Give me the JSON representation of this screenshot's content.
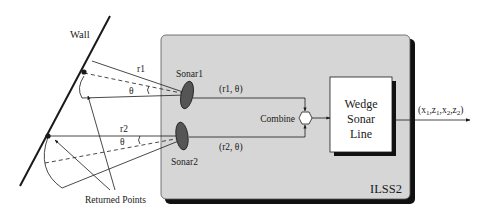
{
  "diagram": {
    "wall": {
      "label": "Wall"
    },
    "beams": [
      {
        "range_label": "r1",
        "angle_label": "θ"
      },
      {
        "range_label": "r2",
        "angle_label": "θ"
      }
    ],
    "returned_points": {
      "label": "Returned Points"
    },
    "system_box": {
      "label": "ILSS2",
      "fill": "#d6d6d6",
      "shadow": "#111111"
    },
    "sonars": [
      {
        "label": "Sonar1",
        "output": "(r1, θ)"
      },
      {
        "label": "Sonar2",
        "output": "(r2, θ)"
      }
    ],
    "combine": {
      "label": "Combine"
    },
    "process_box": {
      "lines": [
        "Wedge",
        "Sonar",
        "Line"
      ]
    },
    "output": {
      "prefix": "(x",
      "parts": [
        {
          "base": "(x",
          "sub": "1"
        },
        {
          "base": ",z",
          "sub": "1"
        },
        {
          "base": ",x",
          "sub": "2"
        },
        {
          "base": ",z",
          "sub": "2"
        }
      ],
      "suffix": ")"
    },
    "colors": {
      "line": "#1a1a1a",
      "sonar_fill": "#555555",
      "box_fill": "#ffffff"
    }
  }
}
